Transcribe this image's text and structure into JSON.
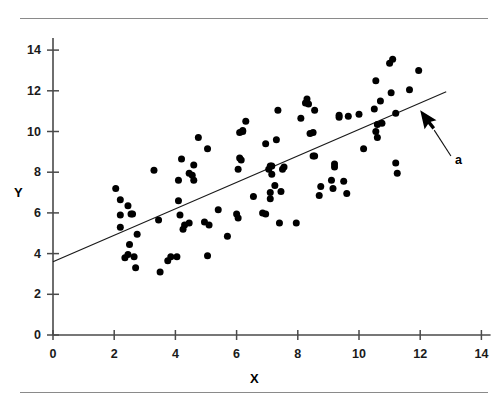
{
  "figure": {
    "top_rule": true,
    "bottom_rule": true,
    "rule_color": "#8a8a8a"
  },
  "chart_data": {
    "type": "scatter",
    "title": "",
    "xlabel": "X",
    "ylabel": "Y",
    "xlim": [
      0,
      14.3
    ],
    "ylim": [
      0,
      14.6
    ],
    "xticks": [
      0,
      2,
      4,
      6,
      8,
      10,
      12,
      14
    ],
    "yticks": [
      0,
      2,
      4,
      6,
      8,
      10,
      12,
      14
    ],
    "xticklabels": [
      "0",
      "2",
      "4",
      "6",
      "8",
      "10",
      "12",
      "14"
    ],
    "yticklabels": [
      "0",
      "2",
      "4",
      "6",
      "8",
      "10",
      "12",
      "14"
    ],
    "grid": false,
    "legend": null,
    "marker_color": "#000000",
    "marker_size": 4.6,
    "line_color": "#1a1a1a",
    "points": [
      [
        2.05,
        7.2
      ],
      [
        2.2,
        6.65
      ],
      [
        2.2,
        5.9
      ],
      [
        2.2,
        5.3
      ],
      [
        2.45,
        6.35
      ],
      [
        2.55,
        5.95
      ],
      [
        2.6,
        5.95
      ],
      [
        2.5,
        4.45
      ],
      [
        2.45,
        3.95
      ],
      [
        2.35,
        3.8
      ],
      [
        2.65,
        3.85
      ],
      [
        2.7,
        3.3
      ],
      [
        2.75,
        4.95
      ],
      [
        3.3,
        8.1
      ],
      [
        3.45,
        5.65
      ],
      [
        3.5,
        3.1
      ],
      [
        3.75,
        3.65
      ],
      [
        3.85,
        3.85
      ],
      [
        4.05,
        3.85
      ],
      [
        4.1,
        6.6
      ],
      [
        4.2,
        8.65
      ],
      [
        4.1,
        7.6
      ],
      [
        4.15,
        5.9
      ],
      [
        4.25,
        5.2
      ],
      [
        4.3,
        5.4
      ],
      [
        4.45,
        5.5
      ],
      [
        4.45,
        7.95
      ],
      [
        4.55,
        7.85
      ],
      [
        4.6,
        8.35
      ],
      [
        4.6,
        7.6
      ],
      [
        4.75,
        9.7
      ],
      [
        4.95,
        5.55
      ],
      [
        5.05,
        3.9
      ],
      [
        5.1,
        5.4
      ],
      [
        5.05,
        9.15
      ],
      [
        5.4,
        6.15
      ],
      [
        5.7,
        4.85
      ],
      [
        6.0,
        5.95
      ],
      [
        6.05,
        5.75
      ],
      [
        6.05,
        8.15
      ],
      [
        6.1,
        8.7
      ],
      [
        6.15,
        8.6
      ],
      [
        6.2,
        10.0
      ],
      [
        6.2,
        10.05
      ],
      [
        6.1,
        9.95
      ],
      [
        6.3,
        10.5
      ],
      [
        6.55,
        6.8
      ],
      [
        6.85,
        6.0
      ],
      [
        6.95,
        5.95
      ],
      [
        6.95,
        9.4
      ],
      [
        7.05,
        8.15
      ],
      [
        7.1,
        8.3
      ],
      [
        7.15,
        8.3
      ],
      [
        7.15,
        7.9
      ],
      [
        7.1,
        7.0
      ],
      [
        7.1,
        6.7
      ],
      [
        7.25,
        7.35
      ],
      [
        7.3,
        9.6
      ],
      [
        7.35,
        11.05
      ],
      [
        7.4,
        5.5
      ],
      [
        7.45,
        7.05
      ],
      [
        7.5,
        8.15
      ],
      [
        7.55,
        8.25
      ],
      [
        7.95,
        5.5
      ],
      [
        8.1,
        10.65
      ],
      [
        8.25,
        11.4
      ],
      [
        8.3,
        11.6
      ],
      [
        8.35,
        11.35
      ],
      [
        8.4,
        9.9
      ],
      [
        8.5,
        9.95
      ],
      [
        8.5,
        8.8
      ],
      [
        8.55,
        8.8
      ],
      [
        8.55,
        11.05
      ],
      [
        8.7,
        6.85
      ],
      [
        8.75,
        7.3
      ],
      [
        9.1,
        7.6
      ],
      [
        9.15,
        7.2
      ],
      [
        9.2,
        8.25
      ],
      [
        9.2,
        8.4
      ],
      [
        9.35,
        10.8
      ],
      [
        9.35,
        10.7
      ],
      [
        9.5,
        7.55
      ],
      [
        9.6,
        6.95
      ],
      [
        9.65,
        10.75
      ],
      [
        10.0,
        10.85
      ],
      [
        10.15,
        9.15
      ],
      [
        10.5,
        11.1
      ],
      [
        10.55,
        12.5
      ],
      [
        10.55,
        10.0
      ],
      [
        10.6,
        9.7
      ],
      [
        10.6,
        10.35
      ],
      [
        10.7,
        11.5
      ],
      [
        10.75,
        10.4
      ],
      [
        11.0,
        13.35
      ],
      [
        11.05,
        11.9
      ],
      [
        11.1,
        13.55
      ],
      [
        11.2,
        10.9
      ],
      [
        11.2,
        8.45
      ],
      [
        11.25,
        7.95
      ],
      [
        11.65,
        12.05
      ],
      [
        11.95,
        13.0
      ]
    ],
    "trendline": {
      "x_start": 0.0,
      "y_start": 3.6,
      "x_end": 12.85,
      "y_end": 11.95
    },
    "annotations": [
      {
        "name": "pointer-arrow",
        "label": "a",
        "pointer_tip_x": 12.0,
        "pointer_tip_y": 11.05,
        "label_x": 13.2,
        "label_y": 8.6
      }
    ]
  }
}
